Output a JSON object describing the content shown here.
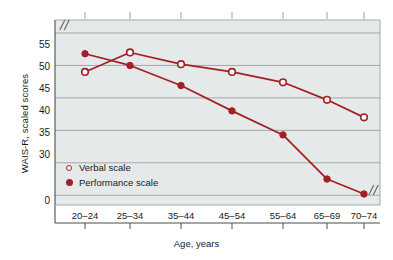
{
  "chart_data": {
    "type": "line",
    "title": "",
    "xlabel": "Age, years",
    "ylabel": "WAIS-R, scaled scores",
    "categories": [
      "20–24",
      "25–34",
      "35–44",
      "45–54",
      "55–64",
      "65–69",
      "70–74"
    ],
    "series": [
      {
        "name": "Verbal scale",
        "marker": "open-circle",
        "color": "#a31f23",
        "values": [
          49,
          52,
          50.2,
          49,
          47.4,
          44.7,
          42
        ]
      },
      {
        "name": "Performance scale",
        "marker": "filled-circle",
        "color": "#a31f23",
        "values": [
          51.8,
          50,
          46.9,
          43,
          39.3,
          32.5,
          30.2
        ]
      }
    ],
    "ylim": [
      28.5,
      57
    ],
    "yticks": [
      30,
      35,
      40,
      45,
      50,
      55
    ],
    "ytick_labels": [
      "30",
      "35",
      "40",
      "45",
      "50",
      "55"
    ],
    "y_zero_label": "0",
    "grid": true,
    "grid_axis": "y",
    "legend_position": "lower-left-inside",
    "axis_break_top_left": "//",
    "axis_break_bottom_right": "//"
  },
  "legend": {
    "items": [
      {
        "label": "Verbal scale"
      },
      {
        "label": "Performance scale"
      }
    ]
  },
  "colors": {
    "series": "#a31f23",
    "plot_background": "#e6e9e9",
    "gridline": "#9aa0a0",
    "axis": "#4a4f4f",
    "text": "#1a1a1a",
    "page_background": "#ffffff"
  }
}
